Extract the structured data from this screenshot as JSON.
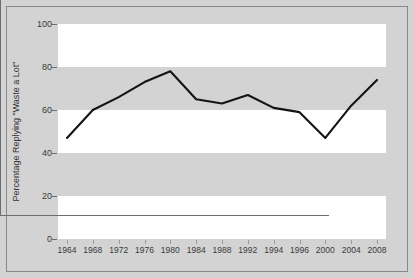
{
  "chart_data": {
    "type": "line",
    "title": "",
    "xlabel": "",
    "ylabel": "Percentage Replying \"Waste a Lot\"",
    "categories": [
      "1964",
      "1968",
      "1972",
      "1976",
      "1980",
      "1984",
      "1988",
      "1992",
      "1994",
      "1996",
      "2000",
      "2004",
      "2008"
    ],
    "values": [
      47,
      60,
      66,
      73,
      78,
      65,
      63,
      67,
      61,
      59,
      47,
      62,
      74
    ],
    "series": [
      {
        "name": "Percentage Replying \"Waste a Lot\"",
        "values": [
          47,
          60,
          66,
          73,
          78,
          65,
          63,
          67,
          61,
          59,
          47,
          62,
          74
        ]
      }
    ],
    "ylim": [
      0,
      100
    ],
    "yticks": [
      0,
      20,
      40,
      60,
      80,
      100
    ],
    "ytick_labels": [
      "0",
      "20",
      "40",
      "60",
      "80",
      "100"
    ],
    "grid": false,
    "banded_background": true,
    "legend": "none",
    "line_color": "#141414",
    "band_color": "#ffffff",
    "plot_background": "#d3d3d3"
  },
  "axes": {
    "y_label": "Percentage Replying \"Waste a Lot\"",
    "y_ticks": [
      {
        "label": "100",
        "value": 100
      },
      {
        "label": "80",
        "value": 80
      },
      {
        "label": "60",
        "value": 60
      },
      {
        "label": "40",
        "value": 40
      },
      {
        "label": "20",
        "value": 20
      },
      {
        "label": "0",
        "value": 0
      }
    ],
    "x_ticks": [
      {
        "label": "1964"
      },
      {
        "label": "1968"
      },
      {
        "label": "1972"
      },
      {
        "label": "1976"
      },
      {
        "label": "1980"
      },
      {
        "label": "1984"
      },
      {
        "label": "1988"
      },
      {
        "label": "1992"
      },
      {
        "label": "1994"
      },
      {
        "label": "1996"
      },
      {
        "label": "2000"
      },
      {
        "label": "2004"
      },
      {
        "label": "2008"
      }
    ]
  },
  "colors": {
    "figure_background": "#d3d3d3",
    "band": "#ffffff",
    "axis": "#6d6d6d",
    "line": "#141414",
    "text": "#3a3a3a",
    "border": "#888888"
  }
}
